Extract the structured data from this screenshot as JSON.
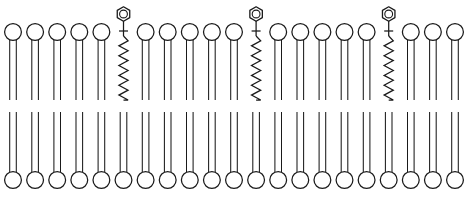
{
  "figure": {
    "width": 467,
    "height": 198,
    "background_color": "#ffffff",
    "stroke_color": "#1a1a1a"
  },
  "diagram": {
    "type": "lipid-bilayer",
    "layers": [
      {
        "name": "outer-leaflet",
        "label": "upper leaflet",
        "head_row_y": 32,
        "tail_end_y": 100
      },
      {
        "name": "inner-leaflet",
        "label": "lower leaflet",
        "head_row_y": 180,
        "tail_end_y": 112
      }
    ],
    "midline_gap": {
      "top_y": 100,
      "bottom_y": 112
    },
    "geometry": {
      "first_x": 13,
      "spacing": 22.1,
      "column_count": 21,
      "head_radius": 8.4,
      "tail_offset": 3.3
    },
    "cholesterol": {
      "column_indices": [
        5,
        11,
        17
      ],
      "ring_sides": 6,
      "ring_radius": 7.2,
      "ring_inner_radius": 3.9,
      "ring_center_y": 14,
      "stem_top_y": 21,
      "stem_bottom_y": 36,
      "crossbar_y": 31,
      "crossbar_half_width": 4.5,
      "zigzag_top_y": 36,
      "zigzag_bottom_y": 100,
      "zigzag_amplitude": 4.6,
      "zigzag_segments": 13
    },
    "phospholipid": {
      "head_shape": "circle",
      "tail_count": 2,
      "tail_style": "straight"
    },
    "counts": {
      "upper_phospholipids": 18,
      "upper_cholesterols": 3,
      "lower_phospholipids": 21,
      "lower_cholesterols": 0,
      "total_molecules": 42
    }
  }
}
